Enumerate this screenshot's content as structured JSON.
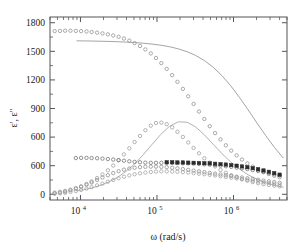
{
  "chart_data": {
    "type": "line",
    "title": "",
    "xlabel": "ω (rad/s)",
    "ylabel": "ε', ε''",
    "xscale": "log",
    "yscale": "linear",
    "xlim": [
      4000,
      5000000
    ],
    "ylim": [
      -60,
      1860
    ],
    "grid": false,
    "legend": "none",
    "x_tick_values": [
      10000,
      100000,
      1000000
    ],
    "x_tick_labels": [
      "10",
      "10",
      "10"
    ],
    "x_tick_exponents": [
      "4",
      "5",
      "6"
    ],
    "y_tick_values": [
      0,
      300,
      600,
      900,
      1200,
      1500,
      1800
    ],
    "y_tick_labels": [
      "0",
      "600",
      "600",
      "900",
      "1200",
      "1500",
      "1800"
    ],
    "colors": {
      "permittivity_markers": "#8f8f8f",
      "permittivity_fit": "#9a9a9a",
      "loss_markers": "#9c9c9c",
      "loss_fit": "#a8a8a8",
      "flat_series": "#6e6e6e",
      "dark_series": "#2b2b2b",
      "frame": "#55555a"
    },
    "series": [
      {
        "name": "real-permittivity-data",
        "marker": "open-circle",
        "color": "#8f8f8f",
        "x": [
          4600,
          5400,
          6300,
          7400,
          8700,
          10200,
          12000,
          14000,
          16500,
          19400,
          22800,
          26800,
          31500,
          37000,
          43500,
          51000,
          60000,
          70500,
          83000,
          97000,
          114000,
          134000,
          158000,
          185000,
          218000,
          256000,
          301000,
          354000,
          416000,
          489000,
          575000,
          676000,
          794000,
          934000,
          1098000,
          1290000,
          1517000,
          1783000,
          2096000,
          2464000,
          2897000,
          3405000,
          4003000
        ],
        "y": [
          1712,
          1714,
          1716,
          1716,
          1714,
          1712,
          1708,
          1702,
          1696,
          1688,
          1678,
          1666,
          1652,
          1634,
          1612,
          1586,
          1556,
          1520,
          1478,
          1430,
          1376,
          1316,
          1250,
          1180,
          1106,
          1028,
          948,
          868,
          790,
          714,
          642,
          576,
          514,
          458,
          408,
          364,
          324,
          290,
          260,
          234,
          212,
          194,
          178
        ]
      },
      {
        "name": "real-permittivity-fit",
        "marker": "line",
        "color": "#9a9a9a",
        "x": [
          9000,
          11000,
          14000,
          18000,
          23000,
          30000,
          39000,
          51000,
          66000,
          86000,
          112000,
          146000,
          190000,
          247000,
          321000,
          418000,
          544000,
          707000,
          920000,
          1197000,
          1557000,
          2025000,
          2634000,
          3426000,
          4456000
        ],
        "y": [
          1610,
          1609,
          1608,
          1606,
          1604,
          1601,
          1597,
          1592,
          1585,
          1576,
          1564,
          1548,
          1526,
          1496,
          1456,
          1402,
          1332,
          1244,
          1138,
          1016,
          884,
          748,
          616,
          492,
          382
        ]
      },
      {
        "name": "dielectric-loss-data",
        "marker": "open-circle",
        "color": "#9c9c9c",
        "x": [
          4600,
          5400,
          6300,
          7400,
          8700,
          10200,
          12000,
          14000,
          16500,
          19400,
          22800,
          26800,
          31500,
          37000,
          43500,
          51000,
          60000,
          70500,
          83000,
          97000,
          114000,
          134000,
          158000,
          185000,
          218000,
          256000,
          301000,
          354000,
          416000,
          489000,
          575000,
          676000,
          794000,
          934000,
          1098000,
          1290000,
          1517000,
          1783000,
          2096000,
          2464000,
          2897000,
          3405000,
          4003000
        ],
        "y": [
          18,
          26,
          36,
          48,
          64,
          84,
          108,
          136,
          170,
          208,
          252,
          302,
          358,
          418,
          482,
          548,
          612,
          672,
          720,
          748,
          752,
          736,
          702,
          656,
          602,
          544,
          486,
          430,
          378,
          332,
          292,
          256,
          226,
          200,
          178,
          158,
          142,
          128,
          116,
          106,
          98,
          90,
          84
        ]
      },
      {
        "name": "dielectric-loss-fit",
        "marker": "line",
        "color": "#a8a8a8",
        "x": [
          9000,
          11000,
          14000,
          18000,
          23000,
          30000,
          39000,
          51000,
          66000,
          86000,
          112000,
          146000,
          190000,
          247000,
          321000,
          418000,
          544000,
          707000,
          920000,
          1197000,
          1557000,
          2025000,
          2634000,
          3426000,
          4456000
        ],
        "y": [
          36,
          48,
          66,
          92,
          126,
          174,
          238,
          318,
          414,
          522,
          628,
          714,
          760,
          756,
          706,
          622,
          524,
          426,
          338,
          264,
          204,
          158,
          122,
          94,
          74
        ]
      },
      {
        "name": "flat-permittivity-series",
        "marker": "open-circle",
        "color": "#6e6e6e",
        "x": [
          8700,
          10200,
          12000,
          14000,
          16500,
          19400,
          22800,
          26800,
          31500,
          37000,
          43500,
          51000,
          60000,
          70500,
          83000,
          97000,
          114000,
          134000,
          158000,
          185000,
          218000,
          256000,
          301000,
          354000,
          416000,
          489000,
          575000,
          676000,
          794000,
          934000,
          1098000,
          1290000,
          1517000,
          1783000,
          2096000,
          2464000,
          2897000,
          3405000,
          4003000
        ],
        "y": [
          380,
          382,
          382,
          380,
          378,
          374,
          370,
          364,
          358,
          352,
          346,
          340,
          336,
          332,
          330,
          330,
          330,
          330,
          330,
          328,
          326,
          324,
          322,
          318,
          314,
          310,
          306,
          300,
          294,
          288,
          280,
          272,
          264,
          254,
          244,
          234,
          222,
          210,
          198
        ]
      },
      {
        "name": "dark-filled-series",
        "marker": "filled-square",
        "color": "#2b2b2b",
        "x": [
          134000,
          158000,
          185000,
          218000,
          256000,
          301000,
          354000,
          416000,
          489000,
          575000,
          676000,
          794000,
          934000,
          1098000,
          1290000,
          1517000,
          1783000,
          2096000,
          2464000,
          2897000,
          3405000,
          4003000
        ],
        "y": [
          336,
          336,
          334,
          334,
          332,
          330,
          328,
          326,
          324,
          320,
          316,
          312,
          306,
          300,
          292,
          284,
          274,
          262,
          250,
          236,
          222,
          206
        ]
      },
      {
        "name": "lower-rising-series",
        "marker": "open-circle",
        "color": "#8a8a8a",
        "x": [
          4600,
          5400,
          6300,
          7400,
          8700,
          10200,
          12000,
          14000,
          16500,
          19400,
          22800,
          26800,
          31500,
          37000,
          43500,
          51000,
          60000,
          70500,
          83000,
          97000,
          114000,
          134000,
          158000,
          185000,
          218000,
          256000,
          301000,
          354000,
          416000,
          489000,
          575000,
          676000,
          794000,
          934000,
          1098000,
          1290000,
          1517000,
          1783000,
          2096000,
          2464000,
          2897000,
          3405000,
          4003000
        ],
        "y": [
          10,
          18,
          28,
          42,
          58,
          78,
          100,
          124,
          150,
          176,
          200,
          222,
          242,
          258,
          270,
          278,
          284,
          288,
          290,
          290,
          288,
          284,
          278,
          272,
          264,
          256,
          248,
          240,
          232,
          224,
          216,
          208,
          200,
          192,
          184,
          176,
          168,
          160,
          152,
          144,
          136,
          128,
          120
        ]
      },
      {
        "name": "lower-baseline-series",
        "marker": "open-circle",
        "color": "#a0a0a0",
        "x": [
          4600,
          5400,
          6300,
          7400,
          8700,
          10200,
          12000,
          14000,
          16500,
          19400,
          22800,
          26800,
          31500,
          37000,
          43500,
          51000,
          60000,
          70500,
          83000,
          97000,
          114000,
          134000,
          158000,
          185000,
          218000,
          256000,
          301000,
          354000,
          416000,
          489000,
          575000,
          676000,
          794000,
          934000,
          1098000,
          1290000,
          1517000,
          1783000,
          2096000,
          2464000,
          2897000,
          3405000,
          4003000
        ],
        "y": [
          6,
          10,
          16,
          24,
          34,
          46,
          60,
          76,
          94,
          112,
          132,
          150,
          168,
          184,
          198,
          210,
          220,
          228,
          234,
          238,
          240,
          240,
          238,
          236,
          232,
          228,
          222,
          216,
          210,
          204,
          198,
          190,
          182,
          174,
          166,
          158,
          150,
          142,
          134,
          126,
          118,
          110,
          102
        ]
      }
    ]
  }
}
